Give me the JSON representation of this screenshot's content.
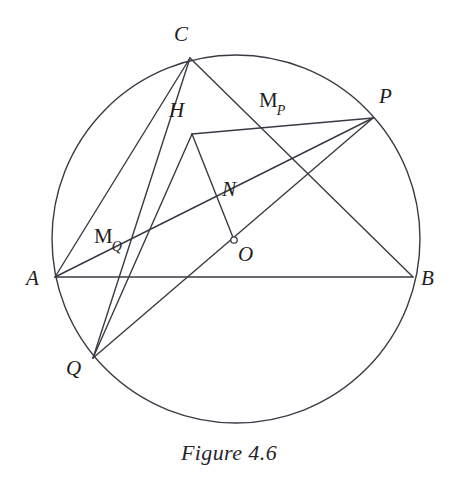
{
  "figure": {
    "caption": "Figure 4.6",
    "caption_position": {
      "x": 0,
      "y": 440
    },
    "background_color": "#ffffff",
    "stroke_color": "#3a3a44",
    "label_color": "#1d1d22",
    "stroke_width": 1.4,
    "width": 458,
    "height": 483
  },
  "circle": {
    "name": "circumcircle",
    "cx": 236,
    "cy": 239,
    "r": 184
  },
  "center_marker": {
    "name": "center-point-O",
    "cx": 234,
    "cy": 240,
    "r": 3.2
  },
  "points": {
    "A": {
      "x": 55,
      "y": 277
    },
    "B": {
      "x": 413,
      "y": 277
    },
    "C": {
      "x": 190,
      "y": 58
    },
    "P": {
      "x": 373,
      "y": 118
    },
    "Q": {
      "x": 93,
      "y": 358
    },
    "H": {
      "x": 192,
      "y": 134
    },
    "N": {
      "x": 222,
      "y": 204
    },
    "O": {
      "x": 234,
      "y": 240
    },
    "MP": {
      "x": 283,
      "y": 124
    },
    "MQ": {
      "x": 143,
      "y": 256
    }
  },
  "segments": [
    {
      "name": "segment-A-B",
      "from": "A",
      "to": "B"
    },
    {
      "name": "segment-A-C",
      "from": "A",
      "to": "C"
    },
    {
      "name": "segment-C-B",
      "from": "C",
      "to": "B"
    },
    {
      "name": "segment-C-Q",
      "from": "C",
      "to": "Q"
    },
    {
      "name": "segment-A-P",
      "from": "A",
      "to": "P"
    },
    {
      "name": "segment-Q-P",
      "from": "Q",
      "to": "P"
    },
    {
      "name": "segment-H-P",
      "from": "H",
      "to": "P"
    },
    {
      "name": "segment-H-Q",
      "from": "H",
      "to": "Q"
    },
    {
      "name": "segment-H-O",
      "from": "H",
      "to": "O"
    }
  ],
  "labels": [
    {
      "name": "label-C",
      "text": "C",
      "sub": "",
      "x": 174,
      "y": 24
    },
    {
      "name": "label-H",
      "text": "H",
      "sub": "",
      "x": 169,
      "y": 100
    },
    {
      "name": "label-MP",
      "text": "M",
      "sub": "P",
      "x": 259,
      "y": 90
    },
    {
      "name": "label-P",
      "text": "P",
      "sub": "",
      "x": 379,
      "y": 86
    },
    {
      "name": "label-N",
      "text": "N",
      "sub": "",
      "x": 222,
      "y": 179
    },
    {
      "name": "label-MQ",
      "text": "M",
      "sub": "Q",
      "x": 94,
      "y": 226
    },
    {
      "name": "label-O",
      "text": "O",
      "sub": "",
      "x": 238,
      "y": 244
    },
    {
      "name": "label-A",
      "text": "A",
      "sub": "",
      "x": 26,
      "y": 268
    },
    {
      "name": "label-B",
      "text": "B",
      "sub": "",
      "x": 421,
      "y": 268
    },
    {
      "name": "label-Q",
      "text": "Q",
      "sub": "",
      "x": 66,
      "y": 358
    }
  ]
}
